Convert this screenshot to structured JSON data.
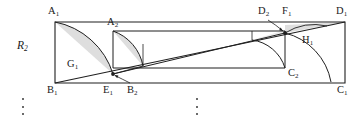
{
  "figure": {
    "type": "geometric-diagram",
    "width": 362,
    "height": 120,
    "background_color": "#ffffff",
    "stroke_color": "#1a1a1a",
    "shade_color": "#d9d9d9",
    "region_label": "R",
    "region_label_sub": "2"
  },
  "labels": {
    "a1": {
      "base": "A",
      "sub": "1"
    },
    "a2": {
      "base": "A",
      "sub": "2"
    },
    "b1": {
      "base": "B",
      "sub": "1"
    },
    "b2": {
      "base": "B",
      "sub": "2"
    },
    "c1": {
      "base": "C",
      "sub": "1"
    },
    "c2": {
      "base": "C",
      "sub": "2"
    },
    "d1": {
      "base": "D",
      "sub": "1"
    },
    "d2": {
      "base": "D",
      "sub": "2"
    },
    "e1": {
      "base": "E",
      "sub": "1"
    },
    "f1": {
      "base": "F",
      "sub": "1"
    },
    "g1": {
      "base": "G",
      "sub": "1"
    },
    "h1": {
      "base": "H",
      "sub": "1"
    }
  },
  "geometry": {
    "outer_rect": {
      "x1": 55,
      "y1": 22,
      "x2": 345,
      "y2": 83
    },
    "inner_rect": {
      "x1": 113,
      "y1": 31,
      "x2": 285,
      "y2": 68
    },
    "diagonal": {
      "x1": 55,
      "y1": 83,
      "x2": 345,
      "y2": 22
    },
    "arc_a1_to_b2": {
      "from": [
        55,
        22
      ],
      "to": [
        113,
        74
      ]
    },
    "arc_a2_to_e1": {
      "from": [
        113,
        31
      ],
      "to": [
        143,
        66
      ]
    },
    "arc_f1_to_c1": {
      "from": [
        285,
        33
      ],
      "to": [
        331,
        82
      ]
    },
    "arc_d2_to_c2": {
      "from": [
        252,
        40
      ],
      "to": [
        285,
        68
      ]
    }
  },
  "ellipses": {
    "left": {
      "x": 22,
      "y": 98
    },
    "middle": {
      "x": 196,
      "y": 98
    }
  }
}
